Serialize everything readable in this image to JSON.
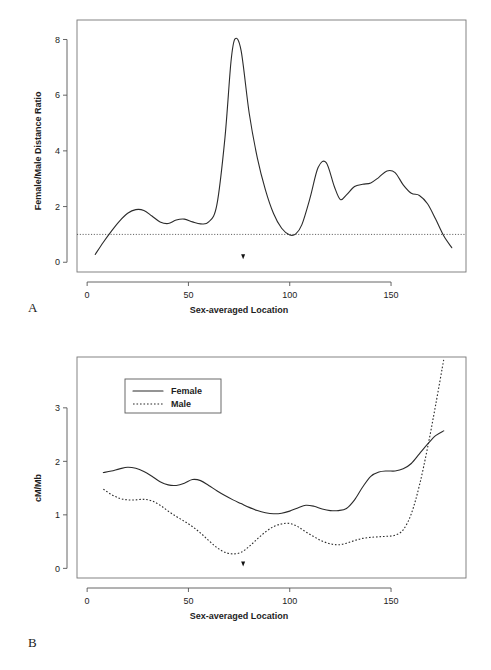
{
  "figure": {
    "panels": [
      {
        "id": "A",
        "label": "A",
        "xlabel": "Sex-averaged Location",
        "ylabel": "Female/Male Distance Ratio"
      },
      {
        "id": "B",
        "label": "B",
        "xlabel": "Sex-averaged Location",
        "ylabel": "cM/Mb"
      }
    ]
  },
  "chart_data": [
    {
      "type": "line",
      "panel": "A",
      "title": "",
      "xlabel": "Sex-averaged Location",
      "ylabel": "Female/Male Distance Ratio",
      "xlim": [
        -5,
        187
      ],
      "ylim": [
        -0.35,
        8.7
      ],
      "xticks": [
        0,
        50,
        100,
        150
      ],
      "xticklabels": [
        "0",
        "50",
        "100",
        "150"
      ],
      "yticks": [
        0,
        2,
        4,
        6,
        8
      ],
      "yticklabels": [
        "0",
        "2",
        "4",
        "6",
        "8"
      ],
      "grid": false,
      "legend": null,
      "reference_line": {
        "y": 1.0,
        "style": "dotted",
        "label": ""
      },
      "annotations": [
        {
          "type": "centromere-marker",
          "symbol": "▼",
          "x": 77,
          "y": 0.2
        }
      ],
      "series": [
        {
          "name": "Female/Male Distance Ratio",
          "style": "solid",
          "x": [
            4,
            8,
            12,
            16,
            20,
            24,
            28,
            32,
            36,
            40,
            44,
            48,
            52,
            56,
            60,
            64,
            68,
            71,
            73,
            76,
            80,
            84,
            88,
            92,
            96,
            100,
            103,
            106,
            110,
            114,
            118,
            122,
            125,
            128,
            132,
            136,
            140,
            144,
            148,
            152,
            156,
            160,
            164,
            168,
            172,
            176,
            180
          ],
          "y": [
            0.28,
            0.72,
            1.12,
            1.48,
            1.76,
            1.89,
            1.86,
            1.66,
            1.45,
            1.39,
            1.52,
            1.55,
            1.45,
            1.38,
            1.45,
            2.05,
            4.45,
            7.2,
            8.02,
            7.6,
            5.35,
            3.75,
            2.6,
            1.75,
            1.22,
            0.98,
            1.02,
            1.35,
            2.3,
            3.4,
            3.58,
            2.72,
            2.25,
            2.42,
            2.72,
            2.8,
            2.85,
            3.05,
            3.28,
            3.22,
            2.78,
            2.48,
            2.4,
            2.1,
            1.55,
            0.95,
            0.52
          ]
        }
      ]
    },
    {
      "type": "line",
      "panel": "B",
      "title": "",
      "xlabel": "Sex-averaged Location",
      "ylabel": "cM/Mb",
      "xlim": [
        -5,
        187
      ],
      "ylim": [
        -0.18,
        3.95
      ],
      "xticks": [
        0,
        50,
        100,
        150
      ],
      "xticklabels": [
        "0",
        "50",
        "100",
        "150"
      ],
      "yticks": [
        0,
        1,
        2,
        3
      ],
      "yticklabels": [
        "0",
        "1",
        "2",
        "3"
      ],
      "grid": false,
      "legend": {
        "position": "top-left",
        "entries": [
          "Female",
          "Male"
        ]
      },
      "annotations": [
        {
          "type": "centromere-marker",
          "symbol": "▼",
          "x": 77,
          "y": 0.08
        }
      ],
      "series": [
        {
          "name": "Female",
          "style": "solid",
          "x": [
            8,
            12,
            16,
            20,
            24,
            28,
            32,
            36,
            40,
            44,
            48,
            52,
            56,
            60,
            64,
            68,
            72,
            76,
            80,
            84,
            88,
            92,
            96,
            100,
            104,
            108,
            112,
            116,
            120,
            124,
            128,
            132,
            136,
            140,
            144,
            148,
            152,
            156,
            160,
            164,
            168,
            172,
            176
          ],
          "y": [
            1.79,
            1.82,
            1.86,
            1.89,
            1.87,
            1.81,
            1.72,
            1.62,
            1.56,
            1.55,
            1.59,
            1.66,
            1.64,
            1.55,
            1.45,
            1.36,
            1.28,
            1.21,
            1.14,
            1.08,
            1.04,
            1.02,
            1.03,
            1.07,
            1.13,
            1.18,
            1.16,
            1.11,
            1.08,
            1.08,
            1.12,
            1.28,
            1.52,
            1.72,
            1.8,
            1.82,
            1.82,
            1.86,
            1.96,
            2.14,
            2.32,
            2.48,
            2.57
          ]
        },
        {
          "name": "Male",
          "style": "dotted",
          "x": [
            8,
            12,
            16,
            20,
            24,
            28,
            32,
            36,
            40,
            44,
            48,
            52,
            56,
            60,
            64,
            68,
            72,
            76,
            80,
            84,
            88,
            92,
            96,
            100,
            104,
            108,
            112,
            116,
            120,
            124,
            128,
            132,
            136,
            140,
            144,
            148,
            152,
            156,
            160,
            164,
            168,
            172,
            176
          ],
          "y": [
            1.48,
            1.38,
            1.31,
            1.28,
            1.28,
            1.29,
            1.26,
            1.18,
            1.07,
            0.97,
            0.88,
            0.78,
            0.66,
            0.52,
            0.39,
            0.3,
            0.27,
            0.3,
            0.41,
            0.55,
            0.68,
            0.78,
            0.83,
            0.84,
            0.78,
            0.68,
            0.59,
            0.51,
            0.46,
            0.44,
            0.47,
            0.52,
            0.56,
            0.58,
            0.59,
            0.6,
            0.62,
            0.72,
            1.02,
            1.55,
            2.25,
            3.05,
            3.9
          ]
        }
      ]
    }
  ]
}
